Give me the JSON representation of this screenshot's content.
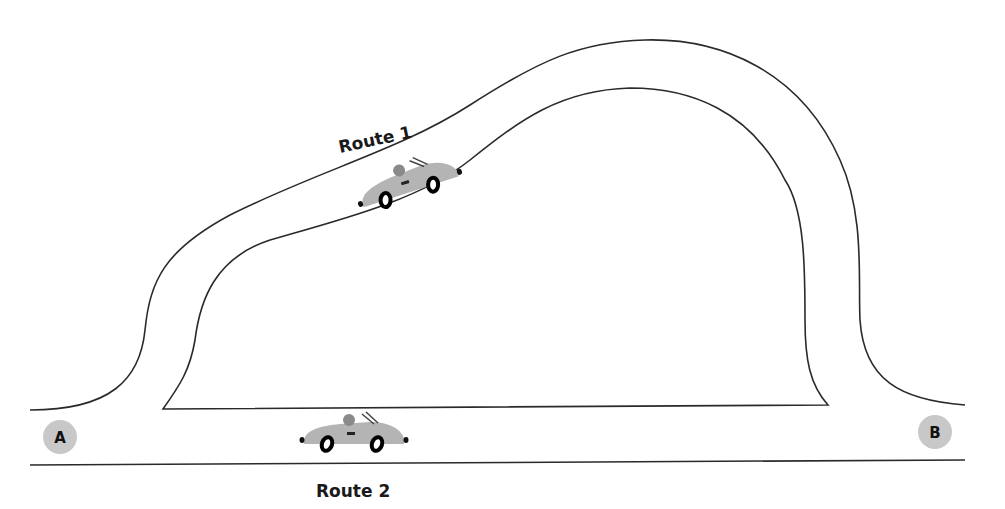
{
  "diagram": {
    "routes": [
      {
        "id": "route-1",
        "label": "Route 1",
        "description": "upper curved road from A to B"
      },
      {
        "id": "route-2",
        "label": "Route 2",
        "description": "straight lower road from A to B"
      }
    ],
    "points": [
      {
        "id": "A",
        "label": "A"
      },
      {
        "id": "B",
        "label": "B"
      }
    ],
    "colors": {
      "road_line": "#2a2a2a",
      "car_body": "#b4b4b4",
      "point_marker": "#c8c8c8",
      "background": "#ffffff"
    }
  }
}
